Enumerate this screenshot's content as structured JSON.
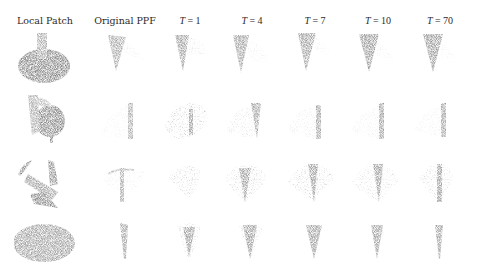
{
  "figure": {
    "columns": [
      {
        "label": "Local Patch",
        "x": 45
      },
      {
        "label": "Original PPF",
        "x": 125
      },
      {
        "var": "T",
        "eq": "=",
        "val": "1",
        "x": 190
      },
      {
        "var": "T",
        "eq": "=",
        "val": "4",
        "x": 252
      },
      {
        "var": "T",
        "eq": "=",
        "val": "7",
        "x": 315
      },
      {
        "var": "T",
        "eq": "=",
        "val": "10",
        "x": 378
      },
      {
        "var": "T",
        "eq": "=",
        "val": "70",
        "x": 440
      }
    ],
    "header_labels": {
      "local_patch": "Local Patch",
      "original_ppf": "Original PPF",
      "t1": "T = 1",
      "t4": "T = 4",
      "t7": "T = 7",
      "t10": "T = 10",
      "t70": "T = 70"
    },
    "rows": [
      {
        "name": "row-1",
        "y": 55
      },
      {
        "name": "row-2",
        "y": 120
      },
      {
        "name": "row-3",
        "y": 187
      },
      {
        "name": "row-4",
        "y": 245
      }
    ],
    "colors": {
      "dark_points": "#3a3a3a",
      "mid_points": "#6e6e6e",
      "light_points": "#b8b8b8",
      "background": "#ffffff"
    }
  }
}
